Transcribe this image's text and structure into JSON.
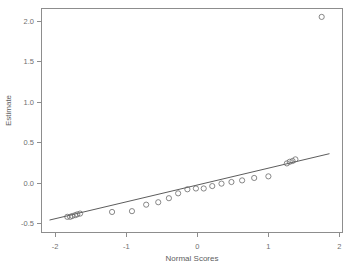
{
  "chart_data": {
    "type": "scatter",
    "title": "",
    "xlabel": "Normal Scores",
    "ylabel": "Estimate",
    "xlim": [
      -2.2,
      2.05
    ],
    "ylim": [
      -0.62,
      2.16
    ],
    "xticks": [
      -2,
      -1,
      0,
      1,
      2
    ],
    "xtick_labels": [
      "-2",
      "-1",
      "0",
      "1",
      "2"
    ],
    "yticks": [
      -0.5,
      0.0,
      0.5,
      1.0,
      1.5,
      2.0
    ],
    "ytick_labels": [
      "-0.5",
      "0.0",
      "0.5",
      "1.0",
      "1.5",
      "2.0"
    ],
    "grid": false,
    "legend": "none",
    "marker": "open-circle",
    "marker_color": "#6a6a6a",
    "line_color": "#4a4a4a",
    "frame_color": "#8d8d8d",
    "series": [
      {
        "name": "Estimate vs Normal Scores",
        "x": [
          -1.83,
          -1.79,
          -1.76,
          -1.72,
          -1.69,
          -1.65,
          -1.2,
          -0.92,
          -0.72,
          -0.55,
          -0.4,
          -0.27,
          -0.14,
          -0.02,
          0.09,
          0.21,
          0.34,
          0.48,
          0.63,
          0.8,
          1.0,
          1.26,
          1.3,
          1.34,
          1.38,
          1.75
        ],
        "y": [
          -0.42,
          -0.42,
          -0.41,
          -0.4,
          -0.39,
          -0.38,
          -0.36,
          -0.35,
          -0.27,
          -0.24,
          -0.19,
          -0.13,
          -0.08,
          -0.07,
          -0.07,
          -0.04,
          -0.01,
          0.01,
          0.03,
          0.06,
          0.08,
          0.24,
          0.26,
          0.27,
          0.29,
          2.05
        ]
      }
    ],
    "reference_line": {
      "name": "fitted normal reference line",
      "x_start": -2.08,
      "y_start": -0.46,
      "x_end": 1.86,
      "y_end": 0.36
    }
  }
}
